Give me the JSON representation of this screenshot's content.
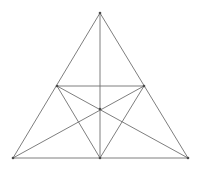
{
  "figure": {
    "canvas": {
      "width": 200,
      "height": 170,
      "background": "#ffffff"
    },
    "style": {
      "line_color": "#6f6f6f",
      "line_width": 0.9,
      "vertex_color": "#4a4a4a",
      "vertex_radius": 1.3
    },
    "points": {
      "apex": {
        "label": "A",
        "x": 100,
        "y": 13
      },
      "bottom_left": {
        "label": "B",
        "x": 13,
        "y": 158
      },
      "bottom_right": {
        "label": "C",
        "x": 188,
        "y": 158
      },
      "mid_left": {
        "label": "F",
        "x": 57,
        "y": 86
      },
      "mid_right": {
        "label": "E",
        "x": 144,
        "y": 86
      },
      "mid_base": {
        "label": "D",
        "x": 100,
        "y": 158
      },
      "centroid": {
        "label": "G",
        "x": 100,
        "y": 109
      }
    },
    "segments": [
      {
        "name": "outer-side-left",
        "x1": 100,
        "y1": 13,
        "x2": 13,
        "y2": 158
      },
      {
        "name": "outer-side-right",
        "x1": 100,
        "y1": 13,
        "x2": 188,
        "y2": 158
      },
      {
        "name": "outer-base",
        "x1": 13,
        "y1": 158,
        "x2": 188,
        "y2": 158
      },
      {
        "name": "midsegment-horizontal",
        "x1": 57,
        "y1": 86,
        "x2": 144,
        "y2": 86
      },
      {
        "name": "median-apex-to-base",
        "x1": 100,
        "y1": 13,
        "x2": 100,
        "y2": 158
      },
      {
        "name": "median-left-to-midright",
        "x1": 13,
        "y1": 158,
        "x2": 144,
        "y2": 86
      },
      {
        "name": "median-right-to-midleft",
        "x1": 188,
        "y1": 158,
        "x2": 57,
        "y2": 86
      },
      {
        "name": "inner-midleft-to-base",
        "x1": 57,
        "y1": 86,
        "x2": 100,
        "y2": 158
      },
      {
        "name": "inner-midright-to-base",
        "x1": 144,
        "y1": 86,
        "x2": 100,
        "y2": 158
      }
    ],
    "vertices_marked": [
      {
        "name": "vertex-apex",
        "x": 100,
        "y": 13
      },
      {
        "name": "vertex-bottom-left",
        "x": 13,
        "y": 158
      },
      {
        "name": "vertex-bottom-right",
        "x": 188,
        "y": 158
      },
      {
        "name": "vertex-mid-left",
        "x": 57,
        "y": 86
      },
      {
        "name": "vertex-mid-right",
        "x": 144,
        "y": 86
      },
      {
        "name": "vertex-mid-base",
        "x": 100,
        "y": 158
      },
      {
        "name": "vertex-centroid",
        "x": 100,
        "y": 109
      }
    ]
  }
}
